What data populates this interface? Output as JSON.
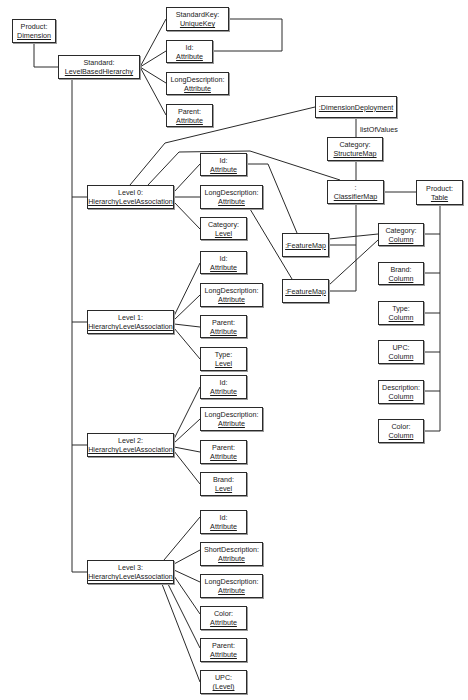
{
  "diagram": {
    "type": "UML object diagram",
    "objects": {
      "product_dimension": {
        "role": "Product:",
        "type": "Dimension"
      },
      "standard_hierarchy": {
        "role": "Standard:",
        "type": "LevelBasedHierarchy"
      },
      "standard_key": {
        "role": "StandardKey:",
        "type": "UniqueKey"
      },
      "std_id": {
        "role": "Id:",
        "type": "Attribute"
      },
      "std_longdesc": {
        "role": "LongDescription:",
        "type": "Attribute"
      },
      "std_parent": {
        "role": "Parent:",
        "type": "Attribute"
      },
      "dimension_deployment": {
        "type": ":DimensionDeployment"
      },
      "category_structuremap": {
        "role": "Category:",
        "type": "StructureMap"
      },
      "classifier_map": {
        "role": ":",
        "type": "ClassifierMap"
      },
      "product_table": {
        "role": "Product:",
        "type": "Table"
      },
      "feature_map_1": {
        "type": ":FeatureMap"
      },
      "feature_map_2": {
        "type": ":FeatureMap"
      },
      "col_category": {
        "role": "Category:",
        "type": "Column"
      },
      "col_brand": {
        "role": "Brand:",
        "type": "Column"
      },
      "col_type": {
        "role": "Type:",
        "type": "Column"
      },
      "col_upc": {
        "role": "UPC:",
        "type": "Column"
      },
      "col_description": {
        "role": "Description:",
        "type": "Column"
      },
      "col_color": {
        "role": "Color:",
        "type": "Column"
      },
      "level0": {
        "role": "Level 0:",
        "type": "HierarchyLevelAssociation"
      },
      "l0_id": {
        "role": "Id:",
        "type": "Attribute"
      },
      "l0_longdesc": {
        "role": "LongDescription:",
        "type": "Attribute"
      },
      "l0_category": {
        "role": "Category:",
        "type": "Level"
      },
      "level1": {
        "role": "Level 1:",
        "type": "HierarchyLevelAssociation"
      },
      "l1_id": {
        "role": "Id:",
        "type": "Attribute"
      },
      "l1_longdesc": {
        "role": "LongDescription:",
        "type": "Attribute"
      },
      "l1_parent": {
        "role": "Parent:",
        "type": "Attribute"
      },
      "l1_type": {
        "role": "Type:",
        "type": "Level"
      },
      "level2": {
        "role": "Level 2:",
        "type": "HierarchyLevelAssociation"
      },
      "l2_id": {
        "role": "Id:",
        "type": "Attribute"
      },
      "l2_longdesc": {
        "role": "LongDescription:",
        "type": "Attribute"
      },
      "l2_parent": {
        "role": "Parent:",
        "type": "Attribute"
      },
      "l2_brand": {
        "role": "Brand:",
        "type": "Level"
      },
      "level3": {
        "role": "Level 3:",
        "type": "HierarchyLevelAssociation"
      },
      "l3_id": {
        "role": "Id:",
        "type": "Attribute"
      },
      "l3_shortdesc": {
        "role": "ShortDescription:",
        "type": "Attribute"
      },
      "l3_longdesc": {
        "role": "LongDescription:",
        "type": "Attribute"
      },
      "l3_color": {
        "role": "Color:",
        "type": "Attribute"
      },
      "l3_parent": {
        "role": "Parent:",
        "type": "Attribute"
      },
      "l3_upc": {
        "role": "UPC:",
        "type": "(Level)"
      }
    },
    "link_labels": {
      "list_of_values": "listOfValues"
    }
  }
}
